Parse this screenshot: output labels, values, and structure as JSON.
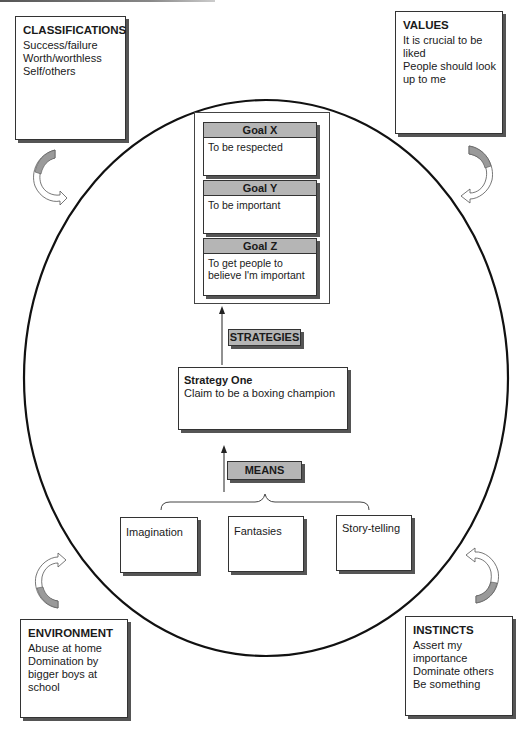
{
  "diagram": {
    "classifications": {
      "title": "CLASSIFICATIONS",
      "items": [
        "Success/failure",
        "Worth/worthless",
        "Self/others"
      ]
    },
    "values": {
      "title": "VALUES",
      "items": [
        "It is crucial to be liked",
        "People should look up to me"
      ]
    },
    "environment": {
      "title": "ENVIRONMENT",
      "items": [
        "Abuse at home",
        "Domination by bigger boys at school"
      ]
    },
    "instincts": {
      "title": "INSTINCTS",
      "items": [
        "Assert my importance",
        "Dominate others",
        "Be something"
      ]
    },
    "goals": [
      {
        "title": "Goal X",
        "text": "To be respected"
      },
      {
        "title": "Goal Y",
        "text": "To be important"
      },
      {
        "title": "Goal Z",
        "text": "To get people to believe I'm important"
      }
    ],
    "strategies_label": "STRATEGIES",
    "strategy": {
      "title": "Strategy One",
      "text": "Claim to be a boxing champion"
    },
    "means_label": "MEANS",
    "means": [
      "Imagination",
      "Fantasies",
      "Story-telling"
    ],
    "colors": {
      "header_fill": "#b5b5b5",
      "border": "#333333",
      "shadow": "#555555",
      "arrow_fill": "#9a9a9a"
    }
  }
}
